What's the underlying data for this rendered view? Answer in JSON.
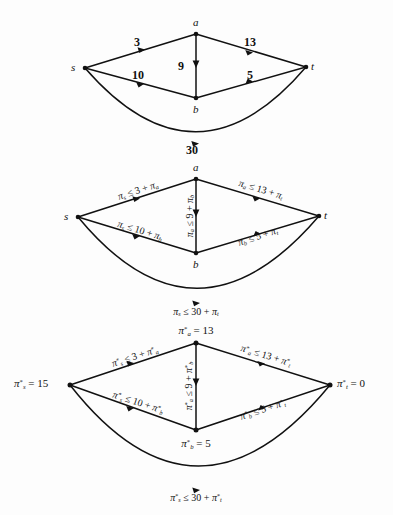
{
  "page": {
    "background": "#fdfdfd",
    "ink": "#111111",
    "width": 393,
    "height": 515
  },
  "figures": [
    {
      "id": "figure-1-weights",
      "caption": "Graph with edge weights",
      "nodes": [
        {
          "key": "s",
          "label": "s",
          "x": 85,
          "y": 68
        },
        {
          "key": "a",
          "label": "a",
          "x": 196,
          "y": 34
        },
        {
          "key": "b",
          "label": "b",
          "x": 196,
          "y": 98
        },
        {
          "key": "t",
          "label": "t",
          "x": 306,
          "y": 67
        }
      ],
      "node_label_offsets": [
        {
          "key": "s",
          "dx": -9,
          "dy": 0,
          "anchor": "right"
        },
        {
          "key": "a",
          "dx": 0,
          "dy": -13,
          "anchor": "center"
        },
        {
          "key": "b",
          "dx": 0,
          "dy": 13,
          "anchor": "center"
        },
        {
          "key": "t",
          "dx": 9,
          "dy": 0,
          "anchor": "left"
        }
      ],
      "edges": [
        {
          "from": "s",
          "to": "a",
          "label": "3",
          "label_x": 139,
          "label_y": 41,
          "type": "straight"
        },
        {
          "from": "a",
          "to": "t",
          "label": "13",
          "label_x": 254,
          "label_y": 41,
          "type": "straight"
        },
        {
          "from": "s",
          "to": "b",
          "label": "10",
          "label_x": 142,
          "label_y": 74,
          "type": "straight"
        },
        {
          "from": "b",
          "to": "t",
          "label": "5",
          "label_x": 251,
          "label_y": 74,
          "type": "straight"
        },
        {
          "from": "a",
          "to": "b",
          "label": "9",
          "label_x": 187,
          "label_y": 64,
          "type": "vertical"
        },
        {
          "from": "s",
          "to": "t",
          "label": "30",
          "label_x": 196,
          "label_y": 150,
          "type": "arc"
        }
      ]
    },
    {
      "id": "figure-2-constraints",
      "caption": "Dual feasibility constraints",
      "nodes": [
        {
          "key": "s",
          "label": "s",
          "x": 78,
          "y": 217
        },
        {
          "key": "a",
          "label": "a",
          "x": 196,
          "y": 179
        },
        {
          "key": "b",
          "label": "b",
          "x": 196,
          "y": 253
        },
        {
          "key": "t",
          "label": "t",
          "x": 319,
          "y": 216
        }
      ],
      "edges": [
        {
          "from": "s",
          "to": "a",
          "label_html": "π<sub>s</sub> ≤ 3 + π<sub>a</sub>",
          "label_x": 138,
          "label_y": 193,
          "rotate": -18
        },
        {
          "from": "a",
          "to": "t",
          "label_html": "π<sub>a</sub> ≤ 13 + π<sub>t</sub>",
          "label_x": 259,
          "label_y": 191,
          "rotate": 17
        },
        {
          "from": "s",
          "to": "b",
          "label_html": "π<sub>s</sub> ≤ 10 + π<sub>b</sub>",
          "label_x": 140,
          "label_y": 231,
          "rotate": 17
        },
        {
          "from": "b",
          "to": "t",
          "label_html": "π<sub>b</sub> ≤ 5 + π<sub>t</sub>",
          "label_x": 257,
          "label_y": 237,
          "rotate": -18
        },
        {
          "from": "a",
          "to": "b",
          "label_html": "π<sub>a</sub> ≤ 9 + π<sub>b</sub>",
          "label_x": 190,
          "label_y": 216,
          "rotate": -90
        },
        {
          "from": "s",
          "to": "t",
          "label_html": "π<sub>s</sub> ≤ 30 + π<sub>t</sub>",
          "label_x": 196,
          "label_y": 310,
          "rotate": 0
        }
      ]
    },
    {
      "id": "figure-3-optimal",
      "caption": "Optimal potentials",
      "nodes": [
        {
          "key": "s",
          "label_html": "π<sup>*</sup><sub>s</sub> = 15",
          "x": 72,
          "y": 385
        },
        {
          "key": "a",
          "label_html": "π<sup>*</sup><sub>a</sub> = 13",
          "x": 196,
          "y": 343
        },
        {
          "key": "b",
          "label_html": "π<sup>*</sup><sub>b</sub> = 5",
          "x": 196,
          "y": 432
        },
        {
          "key": "t",
          "label_html": "π<sup>*</sup><sub>t</sub> = 0",
          "x": 333,
          "y": 385
        }
      ],
      "node_value_labels": [
        {
          "key": "s",
          "text": "π*_s = 15",
          "x": 38,
          "y": 385
        },
        {
          "key": "a",
          "text": "π*_a = 13",
          "x": 196,
          "y": 330
        },
        {
          "key": "b",
          "text": "π*_b = 5",
          "x": 196,
          "y": 446
        },
        {
          "key": "t",
          "text": "π*_t = 0",
          "x": 360,
          "y": 385
        }
      ],
      "edges": [
        {
          "from": "s",
          "to": "a",
          "label_x": 138,
          "label_y": 362,
          "rotate": -18
        },
        {
          "from": "a",
          "to": "t",
          "label_x": 266,
          "label_y": 360,
          "rotate": 17
        },
        {
          "from": "s",
          "to": "b",
          "label_x": 139,
          "label_y": 403,
          "rotate": 18
        },
        {
          "from": "b",
          "to": "t",
          "label_x": 263,
          "label_y": 410,
          "rotate": -18
        },
        {
          "from": "a",
          "to": "b",
          "label_x": 189,
          "label_y": 388,
          "rotate": -90
        },
        {
          "from": "s",
          "to": "t",
          "label_x": 196,
          "label_y": 491,
          "rotate": 0
        }
      ]
    }
  ],
  "labels": {
    "fig1": {
      "node_s": "s",
      "node_a": "a",
      "node_b": "b",
      "node_t": "t",
      "w_sa": "3",
      "w_at": "13",
      "w_sb": "10",
      "w_bt": "5",
      "w_ab": "9",
      "w_st": "30"
    },
    "fig2": {
      "node_s": "s",
      "node_a": "a",
      "node_b": "b",
      "node_t": "t"
    },
    "fig3": {
      "val_s": "= 15",
      "val_a": "= 13",
      "val_b": "= 5",
      "val_t": "= 0"
    }
  }
}
